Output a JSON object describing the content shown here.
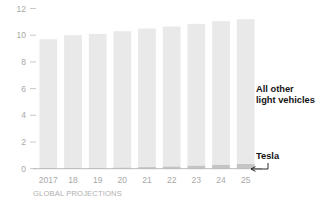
{
  "chart_data": {
    "type": "bar",
    "stacked": true,
    "title": "",
    "subtitle": "",
    "xlabel": "GLOBAL PROJECTIONS",
    "ylabel": "",
    "categories": [
      "2017",
      "18",
      "19",
      "20",
      "21",
      "22",
      "23",
      "24",
      "25"
    ],
    "x_tick_labels": [
      "2017",
      "18",
      "19",
      "20",
      "21",
      "22",
      "23",
      "24",
      "25"
    ],
    "y_tick_labels": [
      "0",
      "2",
      "4",
      "6",
      "8",
      "10",
      "12"
    ],
    "y_ticks": [
      0,
      2,
      4,
      6,
      8,
      10,
      12
    ],
    "ylim": [
      0,
      12
    ],
    "grid": false,
    "legend_position": "right-inline-annotations",
    "series": [
      {
        "name": "Tesla",
        "color": "#c4c4c4",
        "values": [
          0.03,
          0.04,
          0.05,
          0.08,
          0.12,
          0.16,
          0.22,
          0.29,
          0.35
        ]
      },
      {
        "name": "All other light vehicles",
        "color": "#e9e9e9",
        "values": [
          9.67,
          9.96,
          10.05,
          10.22,
          10.38,
          10.49,
          10.63,
          10.76,
          10.85
        ]
      }
    ],
    "totals": [
      9.7,
      10.0,
      10.1,
      10.3,
      10.5,
      10.65,
      10.85,
      11.05,
      11.2
    ],
    "annotations": [
      {
        "name": "all-other-light-vehicles-label",
        "text_line_1": "All other",
        "text_line_2": "light vehicles"
      },
      {
        "name": "tesla-label",
        "text": "Tesla"
      }
    ]
  },
  "colors": {
    "tesla_segment": "#c4c4c4",
    "other_segment": "#e9e9e9",
    "tick_label": "#a8a8a8",
    "caption": "#b0b0b0",
    "annotation_text": "#141414",
    "baseline": "#b9b9b9",
    "background": "#ffffff"
  },
  "axis_caption": {
    "text": "GLOBAL PROJECTIONS"
  }
}
